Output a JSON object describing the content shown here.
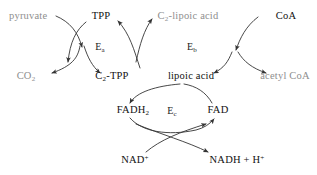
{
  "diagram": {
    "background_color": "#ffffff",
    "stroke_color": "#333333",
    "label_color": "#111111",
    "muted_label_color": "#8e8e8e",
    "labels": {
      "pyruvate": "pyruvate",
      "tpp": "TPP",
      "c2_lipoic_acid_main": "C",
      "c2_lipoic_acid_sub": "2",
      "c2_lipoic_acid_tail": "-lipoic acid",
      "coa": "CoA",
      "co2_main": "CO",
      "co2_sub": "2",
      "c2_tpp_main": "C",
      "c2_tpp_sub": "2",
      "c2_tpp_tail": "-TPP",
      "lipoic_acid": "lipoic acid",
      "acetyl_coa": "acetyl CoA",
      "fadh2_main": "FADH",
      "fadh2_sub": "2",
      "fad": "FAD",
      "nad_main": "NAD",
      "nad_sup": "+",
      "nadh_main": "NADH + H",
      "nadh_sup": "+",
      "enzyme_a_main": "E",
      "enzyme_a_sub": "a",
      "enzyme_b_main": "E",
      "enzyme_b_sub": "b",
      "enzyme_c_main": "E",
      "enzyme_c_sub": "c"
    }
  }
}
